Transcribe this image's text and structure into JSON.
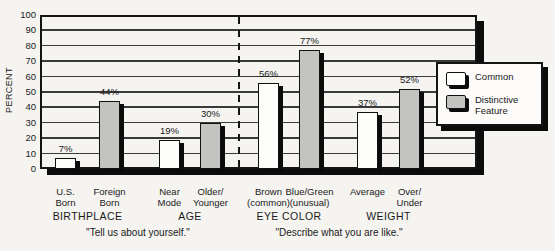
{
  "colors": {
    "background": "#f5f4f1",
    "line_black": "#141414",
    "grid_gray": "#3a3a3a",
    "common_fill": "#fdfdfc",
    "distinctive_fill": "#c3c3c2",
    "text": "#1a1a1a"
  },
  "chart_data": {
    "type": "bar",
    "title": "",
    "ylabel": "PERCENT",
    "xlabel": "",
    "ylim": [
      0,
      100
    ],
    "ytick_step": 10,
    "yticks": [
      100,
      90,
      80,
      70,
      60,
      50,
      40,
      30,
      20,
      10,
      0
    ],
    "grid": true,
    "value_suffix": "%",
    "legend": {
      "position": "right-overlapping-plot",
      "items": [
        {
          "label": "Common",
          "fill": "#fdfdfc"
        },
        {
          "label": "Distinctive\nFeature",
          "series": "Distinctive Feature",
          "fill": "#c3c3c2"
        }
      ]
    },
    "divider_between_sections": "dashed",
    "sections": [
      {
        "caption": "\"Tell us about yourself.\"",
        "groups": [
          {
            "name": "BIRTHPLACE",
            "bars": [
              {
                "label": "U.S.\nBorn",
                "series": "Common",
                "value": 7
              },
              {
                "label": "Foreign\nBorn",
                "series": "Distinctive Feature",
                "value": 44
              }
            ]
          },
          {
            "name": "AGE",
            "bars": [
              {
                "label": "Near\nMode",
                "series": "Common",
                "value": 19
              },
              {
                "label": "Older/\nYounger",
                "series": "Distinctive Feature",
                "value": 30
              }
            ]
          }
        ]
      },
      {
        "caption": "\"Describe what you are like.\"",
        "groups": [
          {
            "name": "EYE COLOR",
            "bars": [
              {
                "label": "Brown\n(common)",
                "series": "Common",
                "value": 56
              },
              {
                "label": "Blue/Green\n(unusual)",
                "series": "Distinctive Feature",
                "value": 77
              }
            ]
          },
          {
            "name": "WEIGHT",
            "bars": [
              {
                "label": "Average",
                "series": "Common",
                "value": 37
              },
              {
                "label": "Over/\nUnder",
                "series": "Distinctive Feature",
                "value": 52
              }
            ]
          }
        ]
      }
    ]
  }
}
